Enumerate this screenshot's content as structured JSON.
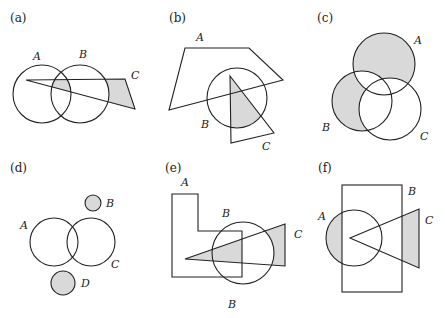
{
  "figure": {
    "panels": [
      {
        "id": "a",
        "label": "(a)",
        "sets": {
          "A": "A",
          "B": "B",
          "C": "C"
        }
      },
      {
        "id": "b",
        "label": "(b)",
        "sets": {
          "A": "A",
          "B": "B",
          "C": "C"
        }
      },
      {
        "id": "c",
        "label": "(c)",
        "sets": {
          "A": "A",
          "B": "B",
          "C": "C"
        }
      },
      {
        "id": "d",
        "label": "(d)",
        "sets": {
          "A": "A",
          "B": "B",
          "C": "C",
          "D": "D"
        }
      },
      {
        "id": "e",
        "label": "(e)",
        "sets": {
          "A": "A",
          "B": "B",
          "C": "C",
          "B2": "B"
        }
      },
      {
        "id": "f",
        "label": "(f)",
        "sets": {
          "A": "A",
          "B": "B",
          "C": "C"
        }
      }
    ],
    "colors": {
      "shade": "#d9d9d9",
      "stroke": "#222222",
      "background": "#ffffff"
    }
  }
}
